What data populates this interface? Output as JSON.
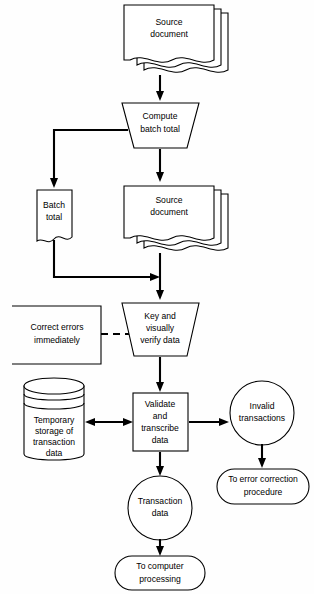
{
  "diagram": {
    "background_color": "#fefefe",
    "line_color": "#000000",
    "nodes": {
      "source_document_top": {
        "label_line1": "Source",
        "label_line2": "document",
        "shape": "multi-document",
        "copies": 3
      },
      "compute_batch_total": {
        "label_line1": "Compute",
        "label_line2": "batch total",
        "shape": "manual-operation-trapezoid"
      },
      "batch_total": {
        "label_line1": "Batch",
        "label_line2": "total",
        "shape": "document"
      },
      "source_document_mid": {
        "label_line1": "Source",
        "label_line2": "document",
        "shape": "multi-document",
        "copies": 3
      },
      "correct_errors": {
        "label_line1": "Correct errors",
        "label_line2": "immediately",
        "shape": "annotation-bracket"
      },
      "key_verify": {
        "label_line1": "Key and",
        "label_line2": "visually",
        "label_line3": "verify data",
        "shape": "manual-operation-trapezoid"
      },
      "temporary_storage": {
        "label_line1": "Temporary",
        "label_line2": "storage of",
        "label_line3": "transaction",
        "label_line4": "data",
        "shape": "magnetic-disk-cylinder"
      },
      "validate_transcribe": {
        "label_line1": "Validate",
        "label_line2": "and",
        "label_line3": "transcribe",
        "label_line4": "data",
        "shape": "process-rectangle"
      },
      "invalid_transactions": {
        "label_line1": "Invalid",
        "label_line2": "transactions",
        "shape": "circle"
      },
      "transaction_data": {
        "label_line1": "Transaction",
        "label_line2": "data",
        "shape": "circle"
      },
      "to_error_correction": {
        "label_line1": "To error correction",
        "label_line2": "procedure",
        "shape": "terminator-stadium"
      },
      "to_computer_processing": {
        "label_line1": "To computer",
        "label_line2": "processing",
        "shape": "terminator-stadium"
      }
    },
    "edges": [
      {
        "from": "source_document_top",
        "to": "compute_batch_total",
        "style": "solid-arrow"
      },
      {
        "from": "compute_batch_total",
        "to": "batch_total",
        "style": "solid-arrow-elbow-left"
      },
      {
        "from": "compute_batch_total",
        "to": "source_document_mid",
        "style": "solid-arrow"
      },
      {
        "from": "batch_total",
        "to": "key_verify",
        "style": "solid-arrow-elbow-right"
      },
      {
        "from": "source_document_mid",
        "to": "key_verify",
        "style": "solid-arrow"
      },
      {
        "from": "correct_errors",
        "to": "key_verify",
        "style": "dashed-annotation"
      },
      {
        "from": "key_verify",
        "to": "validate_transcribe",
        "style": "solid-arrow"
      },
      {
        "from": "validate_transcribe",
        "to": "temporary_storage",
        "style": "solid-bidirectional-arrow"
      },
      {
        "from": "validate_transcribe",
        "to": "invalid_transactions",
        "style": "solid-arrow"
      },
      {
        "from": "validate_transcribe",
        "to": "transaction_data",
        "style": "solid-arrow"
      },
      {
        "from": "invalid_transactions",
        "to": "to_error_correction",
        "style": "solid-arrow"
      },
      {
        "from": "transaction_data",
        "to": "to_computer_processing",
        "style": "solid-arrow"
      }
    ]
  }
}
